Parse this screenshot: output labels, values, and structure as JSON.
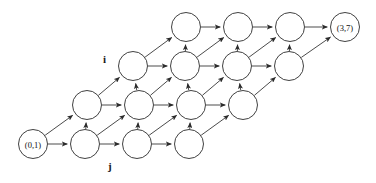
{
  "figure": {
    "type": "lattice-diagram",
    "width": 376,
    "height": 183,
    "background_color": "#ffffff",
    "line_color": "#2b2b2b",
    "node_fill": "#ffffff"
  },
  "axis_labels": [
    {
      "name": "i-axis-label",
      "text": "i",
      "x": 103,
      "y": 54
    },
    {
      "name": "j-axis-label",
      "text": "j",
      "x": 108,
      "y": 161
    }
  ],
  "nodes": [
    {
      "id": "n_0_0",
      "label": "(0,1)",
      "x": 33,
      "y": 144,
      "r": 14.5,
      "row": 0,
      "col": 0
    },
    {
      "id": "n_0_1",
      "label": "",
      "x": 85,
      "y": 144,
      "r": 14.5,
      "row": 0,
      "col": 1
    },
    {
      "id": "n_0_2",
      "label": "",
      "x": 137,
      "y": 144,
      "r": 14.5,
      "row": 0,
      "col": 2
    },
    {
      "id": "n_0_3",
      "label": "",
      "x": 189,
      "y": 144,
      "r": 14.5,
      "row": 0,
      "col": 3
    },
    {
      "id": "n_1_0",
      "label": "",
      "x": 87,
      "y": 105,
      "r": 14.5,
      "row": 1,
      "col": 0
    },
    {
      "id": "n_1_1",
      "label": "",
      "x": 139,
      "y": 105,
      "r": 14.5,
      "row": 1,
      "col": 1
    },
    {
      "id": "n_1_2",
      "label": "",
      "x": 191,
      "y": 105,
      "r": 14.5,
      "row": 1,
      "col": 2
    },
    {
      "id": "n_1_3",
      "label": "",
      "x": 243,
      "y": 105,
      "r": 14.5,
      "row": 1,
      "col": 3
    },
    {
      "id": "n_2_0",
      "label": "",
      "x": 133,
      "y": 66,
      "r": 14.5,
      "row": 2,
      "col": 0
    },
    {
      "id": "n_2_1",
      "label": "",
      "x": 185,
      "y": 66,
      "r": 14.5,
      "row": 2,
      "col": 1
    },
    {
      "id": "n_2_2",
      "label": "",
      "x": 237,
      "y": 66,
      "r": 14.5,
      "row": 2,
      "col": 2
    },
    {
      "id": "n_2_3",
      "label": "",
      "x": 289,
      "y": 66,
      "r": 14.5,
      "row": 2,
      "col": 3
    },
    {
      "id": "n_3_0",
      "label": "",
      "x": 186,
      "y": 27,
      "r": 14.5,
      "row": 3,
      "col": 0
    },
    {
      "id": "n_3_1",
      "label": "",
      "x": 238,
      "y": 27,
      "r": 14.5,
      "row": 3,
      "col": 1
    },
    {
      "id": "n_3_2",
      "label": "",
      "x": 290,
      "y": 27,
      "r": 14.5,
      "row": 3,
      "col": 2
    },
    {
      "id": "n_3_3",
      "label": "(3,7)",
      "x": 345,
      "y": 27,
      "r": 14.5,
      "row": 3,
      "col": 3
    }
  ],
  "edges": [
    {
      "from": "n_0_0",
      "to": "n_0_1",
      "kind": "horizontal"
    },
    {
      "from": "n_0_1",
      "to": "n_0_2",
      "kind": "horizontal"
    },
    {
      "from": "n_0_2",
      "to": "n_0_3",
      "kind": "horizontal"
    },
    {
      "from": "n_1_0",
      "to": "n_1_1",
      "kind": "horizontal"
    },
    {
      "from": "n_1_1",
      "to": "n_1_2",
      "kind": "horizontal"
    },
    {
      "from": "n_1_2",
      "to": "n_1_3",
      "kind": "horizontal"
    },
    {
      "from": "n_2_0",
      "to": "n_2_1",
      "kind": "horizontal"
    },
    {
      "from": "n_2_1",
      "to": "n_2_2",
      "kind": "horizontal"
    },
    {
      "from": "n_2_2",
      "to": "n_2_3",
      "kind": "horizontal"
    },
    {
      "from": "n_3_0",
      "to": "n_3_1",
      "kind": "horizontal"
    },
    {
      "from": "n_3_1",
      "to": "n_3_2",
      "kind": "horizontal"
    },
    {
      "from": "n_3_2",
      "to": "n_3_3",
      "kind": "horizontal"
    },
    {
      "from": "n_0_1",
      "to": "n_1_0",
      "kind": "vertical"
    },
    {
      "from": "n_0_2",
      "to": "n_1_1",
      "kind": "vertical"
    },
    {
      "from": "n_0_3",
      "to": "n_1_2",
      "kind": "vertical"
    },
    {
      "from": "n_1_1",
      "to": "n_2_0",
      "kind": "vertical"
    },
    {
      "from": "n_1_2",
      "to": "n_2_1",
      "kind": "vertical"
    },
    {
      "from": "n_1_3",
      "to": "n_2_2",
      "kind": "vertical"
    },
    {
      "from": "n_2_1",
      "to": "n_3_0",
      "kind": "vertical"
    },
    {
      "from": "n_2_2",
      "to": "n_3_1",
      "kind": "vertical"
    },
    {
      "from": "n_2_3",
      "to": "n_3_2",
      "kind": "vertical"
    },
    {
      "from": "n_0_0",
      "to": "n_1_0",
      "kind": "diagonal"
    },
    {
      "from": "n_0_1",
      "to": "n_1_1",
      "kind": "diagonal"
    },
    {
      "from": "n_0_2",
      "to": "n_1_2",
      "kind": "diagonal"
    },
    {
      "from": "n_0_3",
      "to": "n_1_3",
      "kind": "diagonal"
    },
    {
      "from": "n_1_0",
      "to": "n_2_0",
      "kind": "diagonal"
    },
    {
      "from": "n_1_1",
      "to": "n_2_1",
      "kind": "diagonal"
    },
    {
      "from": "n_1_2",
      "to": "n_2_2",
      "kind": "diagonal"
    },
    {
      "from": "n_1_3",
      "to": "n_2_3",
      "kind": "diagonal"
    },
    {
      "from": "n_2_0",
      "to": "n_3_0",
      "kind": "diagonal"
    },
    {
      "from": "n_2_1",
      "to": "n_3_1",
      "kind": "diagonal"
    },
    {
      "from": "n_2_2",
      "to": "n_3_2",
      "kind": "diagonal"
    },
    {
      "from": "n_2_3",
      "to": "n_3_3",
      "kind": "diagonal"
    }
  ]
}
